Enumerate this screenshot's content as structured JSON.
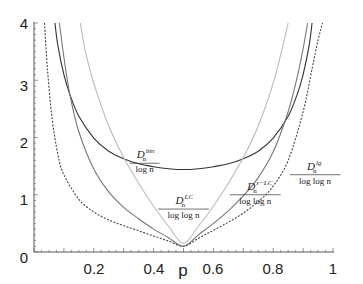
{
  "chart_data": {
    "type": "line",
    "title": "",
    "xlabel": "p",
    "ylabel": "",
    "xlim": [
      0,
      1
    ],
    "ylim": [
      0,
      4
    ],
    "grid": false,
    "legend": "inline annotations",
    "x_ticks": [
      "0.2",
      "0.4",
      "0.6",
      "0.8",
      "1"
    ],
    "y_ticks": [
      "0",
      "1",
      "2",
      "3",
      "4"
    ],
    "series": [
      {
        "name": "D_n^bin / log n",
        "color": "#333333",
        "style": "solid",
        "x": [
          0.07,
          0.08,
          0.1,
          0.12,
          0.15,
          0.2,
          0.25,
          0.3,
          0.35,
          0.4,
          0.45,
          0.5,
          0.55,
          0.6,
          0.65,
          0.7,
          0.75,
          0.8,
          0.85,
          0.88,
          0.9,
          0.92,
          0.93
        ],
        "y": [
          4.0,
          3.6,
          3.1,
          2.75,
          2.37,
          1.99,
          1.76,
          1.63,
          1.54,
          1.49,
          1.455,
          1.44,
          1.455,
          1.49,
          1.54,
          1.63,
          1.76,
          1.99,
          2.37,
          2.75,
          3.1,
          3.6,
          4.0
        ]
      },
      {
        "name": "D_n^LC / log log n",
        "color": "#bbbbbb",
        "style": "solid",
        "x": [
          0.155,
          0.17,
          0.2,
          0.25,
          0.3,
          0.35,
          0.4,
          0.45,
          0.5,
          0.55,
          0.6,
          0.65,
          0.7,
          0.75,
          0.8,
          0.83,
          0.85
        ],
        "y": [
          4.0,
          3.55,
          2.95,
          2.2,
          1.65,
          1.2,
          0.8,
          0.45,
          0.15,
          0.45,
          0.8,
          1.2,
          1.65,
          2.2,
          2.95,
          3.55,
          4.0
        ]
      },
      {
        "name": "D_n^{ε-LC} / log log n",
        "color": "#777777",
        "style": "solid",
        "x": [
          0.085,
          0.1,
          0.12,
          0.15,
          0.2,
          0.25,
          0.3,
          0.35,
          0.4,
          0.45,
          0.5,
          0.55,
          0.6,
          0.65,
          0.7,
          0.75,
          0.8,
          0.85,
          0.88,
          0.9,
          0.915
        ],
        "y": [
          4.0,
          3.4,
          2.75,
          2.1,
          1.45,
          1.05,
          0.78,
          0.58,
          0.4,
          0.25,
          0.1,
          0.3,
          0.5,
          0.72,
          0.98,
          1.3,
          1.75,
          2.45,
          3.05,
          3.55,
          4.0
        ]
      },
      {
        "name": "D_n^lg / log log n",
        "color": "#444444",
        "style": "dashed",
        "x": [
          0.035,
          0.045,
          0.06,
          0.08,
          0.1,
          0.15,
          0.2,
          0.25,
          0.3,
          0.35,
          0.4,
          0.45,
          0.5,
          0.55,
          0.6,
          0.65,
          0.7,
          0.75,
          0.8,
          0.85,
          0.9,
          0.93,
          0.95,
          0.965
        ],
        "y": [
          4.0,
          3.2,
          2.35,
          1.7,
          1.35,
          0.92,
          0.7,
          0.56,
          0.46,
          0.37,
          0.28,
          0.19,
          0.1,
          0.24,
          0.38,
          0.52,
          0.68,
          0.88,
          1.15,
          1.6,
          2.45,
          3.2,
          3.7,
          4.0
        ]
      }
    ],
    "annotations": [
      {
        "id": "bin",
        "numerator": "D",
        "sub": "n",
        "sup": "bin",
        "denominator": "log n",
        "x": 0.37,
        "y": 1.55
      },
      {
        "id": "lc",
        "numerator": "D",
        "sub": "n",
        "sup": "LC",
        "denominator": "log log n",
        "x": 0.5,
        "y": 0.75
      },
      {
        "id": "elc",
        "numerator": "D",
        "sub": "n",
        "sup": "ε−LC",
        "denominator": "log log n",
        "x": 0.74,
        "y": 1.0
      },
      {
        "id": "lg",
        "numerator": "D",
        "sub": "n",
        "sup": "lg",
        "denominator": "log log n",
        "x": 0.94,
        "y": 1.35
      }
    ]
  }
}
